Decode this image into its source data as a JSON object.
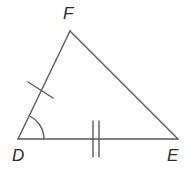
{
  "figure": {
    "kind": "geometry-triangle-diagram",
    "background_color": "#ffffff",
    "stroke_color": "#5a5a5a",
    "label_color": "#2b2b2b",
    "stroke_width": 1.4,
    "width": 193,
    "height": 176
  },
  "vertices": [
    {
      "name": "F",
      "label": "F",
      "x": 70,
      "y": 31,
      "label_x": 63,
      "label_y": 5
    },
    {
      "name": "D",
      "label": "D",
      "x": 18,
      "y": 139,
      "label_x": 12,
      "label_y": 147
    },
    {
      "name": "E",
      "label": "E",
      "x": 178,
      "y": 139,
      "label_x": 167,
      "label_y": 147
    }
  ],
  "sides": [
    {
      "name": "DF",
      "from": "D",
      "to": "F",
      "tick_count": 1
    },
    {
      "name": "FE",
      "from": "F",
      "to": "E",
      "tick_count": 0
    },
    {
      "name": "DE",
      "from": "D",
      "to": "E",
      "tick_count": 2
    }
  ],
  "marks": {
    "single_tick_DF": {
      "label": "single-tick-mark",
      "x1": 28,
      "y1": 82,
      "x2": 53,
      "y2": 98
    },
    "double_tick_DE": {
      "label": "double-tick-mark",
      "tick1": {
        "x1": 93,
        "y1": 121,
        "x2": 93,
        "y2": 157
      },
      "tick2": {
        "x1": 99,
        "y1": 121,
        "x2": 99,
        "y2": 157
      }
    },
    "angle_arc_D": {
      "label": "angle-arc",
      "vertex": "D",
      "radius": 26,
      "path": "M 44 139 A 26 26 0 0 0 30.5 116.5"
    }
  },
  "geometry_paths": {
    "triangle_outline": "M 18 139 L 70 31 L 178 139 Z"
  }
}
